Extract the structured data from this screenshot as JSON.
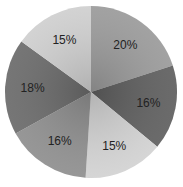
{
  "chart_data": {
    "type": "pie",
    "title": "",
    "categories": [
      "Slice 1",
      "Slice 2",
      "Slice 3",
      "Slice 4",
      "Slice 5",
      "Slice 6"
    ],
    "values": [
      20,
      16,
      15,
      16,
      18,
      15
    ],
    "labels": [
      "20%",
      "16%",
      "15%",
      "16%",
      "18%",
      "15%"
    ],
    "colors": [
      "#9a9a9a",
      "#5e5e5e",
      "#d2d2d2",
      "#8e8e8e",
      "#6a6a6a",
      "#cfcfcf"
    ],
    "start_angle_deg": 0,
    "direction": "clockwise",
    "legend": "none"
  }
}
